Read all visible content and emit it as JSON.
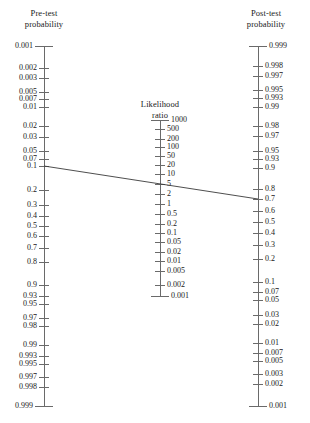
{
  "figure": {
    "kind": "fagan-nomogram",
    "width": 310,
    "height": 423,
    "background": "#ffffff",
    "axis_color": "#6a6a6a",
    "line_color": "#3a3a3a",
    "text_color": "#1a1a1a"
  },
  "left_axis": {
    "title_line1": "Pre-test",
    "title_line2": "probability",
    "x": 44,
    "y_top": 46,
    "y_bottom": 406,
    "tick_len": 9,
    "labels": [
      "0.001",
      "0.002",
      "0.003",
      "0.005",
      "0.007",
      "0.01",
      "0.02",
      "0.03",
      "0.05",
      "0.07",
      "0.1",
      "0.2",
      "0.3",
      "0.4",
      "0.5",
      "0.6",
      "0.7",
      "0.8",
      "0.9",
      "0.93",
      "0.95",
      "0.97",
      "0.98",
      "0.99",
      "0.993",
      "0.995",
      "0.997",
      "0.998",
      "0.999"
    ],
    "values": [
      0.001,
      0.002,
      0.003,
      0.005,
      0.007,
      0.01,
      0.02,
      0.03,
      0.05,
      0.07,
      0.1,
      0.2,
      0.3,
      0.4,
      0.5,
      0.6,
      0.7,
      0.8,
      0.9,
      0.93,
      0.95,
      0.97,
      0.98,
      0.99,
      0.993,
      0.995,
      0.997,
      0.998,
      0.999
    ],
    "y_positions": [
      46,
      68,
      78,
      92,
      99,
      107,
      126,
      137,
      151,
      159,
      166,
      190,
      205,
      216,
      226,
      236,
      248,
      262,
      285,
      296,
      304,
      318,
      326,
      345,
      356,
      364,
      377,
      387,
      406
    ]
  },
  "middle_axis": {
    "title_line1": "Likelihood",
    "title_line2": "ratio",
    "x": 160,
    "y_top": 120,
    "y_bottom": 296,
    "tick_len": 9,
    "labels": [
      "1000",
      "500",
      "200",
      "100",
      "50",
      "20",
      "10",
      "5",
      "2",
      "1",
      "0.5",
      "0.2",
      "0.1",
      "0.05",
      "0.02",
      "0.01",
      "0.005",
      "0.002",
      "0.001"
    ],
    "values": [
      1000,
      500,
      200,
      100,
      50,
      20,
      10,
      5,
      2,
      1,
      0.5,
      0.2,
      0.1,
      0.05,
      0.02,
      0.01,
      0.005,
      0.002,
      0.001
    ],
    "y_positions": [
      120,
      129,
      139,
      147,
      156,
      165,
      174,
      184,
      194,
      204,
      214,
      224,
      233,
      242,
      252,
      261,
      271,
      285,
      296
    ]
  },
  "right_axis": {
    "title_line1": "Post-test",
    "title_line2": "probability",
    "x": 258,
    "y_top": 46,
    "y_bottom": 406,
    "tick_len": 9,
    "labels": [
      "0.999",
      "0.998",
      "0.997",
      "0.995",
      "0.993",
      "0.99",
      "0.98",
      "0.97",
      "0.95",
      "0.93",
      "0.9",
      "0.8",
      "0.7",
      "0.6",
      "0.5",
      "0.4",
      "0.3",
      "0.2",
      "0.1",
      "0.07",
      "0.05",
      "0.03",
      "0.02",
      "0.01",
      "0.007",
      "0.005",
      "0.003",
      "0.002",
      "0.001"
    ],
    "values": [
      0.999,
      0.998,
      0.997,
      0.995,
      0.993,
      0.99,
      0.98,
      0.97,
      0.95,
      0.93,
      0.9,
      0.8,
      0.7,
      0.6,
      0.5,
      0.4,
      0.3,
      0.2,
      0.1,
      0.07,
      0.05,
      0.03,
      0.02,
      0.01,
      0.007,
      0.005,
      0.003,
      0.002,
      0.001
    ],
    "y_positions": [
      46,
      66,
      76,
      90,
      98,
      107,
      126,
      136,
      151,
      159,
      168,
      189,
      199,
      211,
      222,
      233,
      245,
      259,
      282,
      292,
      300,
      315,
      324,
      343,
      353,
      361,
      374,
      384,
      406
    ]
  },
  "reading_line": {
    "label": "worked-example-line",
    "pre_test_probability": "0.1",
    "likelihood_ratio": "20",
    "post_test_probability": "0.7",
    "x1": 44,
    "y1": 166,
    "x2": 258,
    "y2": 199,
    "color": "#3a3a3a"
  },
  "chart_data": {
    "type": "line",
    "xlabel": "",
    "ylabel": "",
    "series": [
      {
        "name": "Pre-test probability scale",
        "orientation": "vertical",
        "scale": "logit",
        "direction": "top-to-bottom increasing",
        "tick_values": [
          0.001,
          0.002,
          0.003,
          0.005,
          0.007,
          0.01,
          0.02,
          0.03,
          0.05,
          0.07,
          0.1,
          0.2,
          0.3,
          0.4,
          0.5,
          0.6,
          0.7,
          0.8,
          0.9,
          0.93,
          0.95,
          0.97,
          0.98,
          0.99,
          0.993,
          0.995,
          0.997,
          0.998,
          0.999
        ]
      },
      {
        "name": "Likelihood ratio scale",
        "orientation": "vertical",
        "scale": "log",
        "direction": "top-to-bottom decreasing",
        "tick_values": [
          1000,
          500,
          200,
          100,
          50,
          20,
          10,
          5,
          2,
          1,
          0.5,
          0.2,
          0.1,
          0.05,
          0.02,
          0.01,
          0.005,
          0.002,
          0.001
        ]
      },
      {
        "name": "Post-test probability scale",
        "orientation": "vertical",
        "scale": "logit",
        "direction": "top-to-bottom decreasing",
        "tick_values": [
          0.999,
          0.998,
          0.997,
          0.995,
          0.993,
          0.99,
          0.98,
          0.97,
          0.95,
          0.93,
          0.9,
          0.8,
          0.7,
          0.6,
          0.5,
          0.4,
          0.3,
          0.2,
          0.1,
          0.07,
          0.05,
          0.03,
          0.02,
          0.01,
          0.007,
          0.005,
          0.003,
          0.002,
          0.001
        ]
      }
    ],
    "annotations": [
      {
        "name": "reading-line",
        "from_axis": "Pre-test probability",
        "from_value": 0.1,
        "through_axis": "Likelihood ratio",
        "through_value": 20,
        "to_axis": "Post-test probability",
        "to_value": 0.7
      }
    ],
    "grid": false,
    "legend": "none"
  }
}
